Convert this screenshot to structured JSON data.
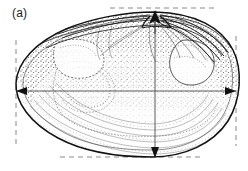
{
  "figure": {
    "panel_label": "(a)",
    "orientation": "umbo-top-center",
    "background_color": "#ffffff",
    "ink_color": "#1b1b1b",
    "stipple_color": "#2a2a2a",
    "guide_color": "#777777",
    "width_px": 248,
    "height_px": 171
  },
  "measurements": {
    "length_axis": {
      "name": "shell-length",
      "kind": "double-headed-horizontal-arrow",
      "y": 91,
      "x_start": 16,
      "x_end": 236
    },
    "height_axis": {
      "name": "shell-height",
      "kind": "double-headed-vertical-arrow",
      "x": 155,
      "y_start": 12,
      "y_end": 157
    }
  },
  "guides": {
    "top_dashed": {
      "name": "dorsal-tangent",
      "y": 8,
      "x_start": 110,
      "x_end": 216
    },
    "bottom_dashed": {
      "name": "ventral-tangent",
      "y": 157,
      "x_start": 60,
      "x_end": 202
    },
    "left_dashed": {
      "name": "anterior-tangent",
      "x": 16,
      "y_start": 40,
      "y_end": 146
    },
    "right_dashed": {
      "name": "posterior-tangent",
      "x": 236,
      "y_start": 36,
      "y_end": 146
    }
  },
  "shell_features": [
    {
      "name": "umbo-beak",
      "label": "umbo"
    },
    {
      "name": "dorsal-margin",
      "label": "dorsal margin"
    },
    {
      "name": "ventral-margin",
      "label": "ventral margin"
    },
    {
      "name": "anterior-adductor-scar",
      "label": "anterior adductor muscle scar"
    },
    {
      "name": "posterior-adductor-scar",
      "label": "posterior adductor muscle scar"
    },
    {
      "name": "pallial-line",
      "label": "pallial line"
    },
    {
      "name": "pallial-sinus",
      "label": "pallial sinus"
    },
    {
      "name": "hinge-plate",
      "label": "hinge plate"
    },
    {
      "name": "ligament-lines",
      "label": "ligament / escutcheon lines"
    },
    {
      "name": "stippled-shading",
      "label": "stippled interior shading"
    }
  ]
}
